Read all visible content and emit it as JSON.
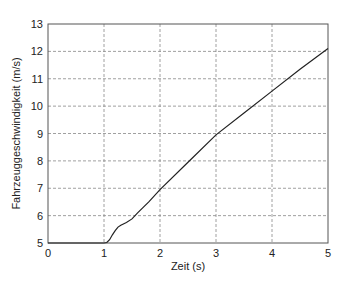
{
  "chart_data": {
    "type": "line",
    "title": "",
    "xlabel": "Zeit (s)",
    "ylabel": "Fahrzeuggeschwindigkeit (m/s)",
    "xlim": [
      0,
      5
    ],
    "ylim": [
      5,
      13
    ],
    "xticks": [
      0,
      1,
      2,
      3,
      4,
      5
    ],
    "yticks": [
      5,
      6,
      7,
      8,
      9,
      10,
      11,
      12,
      13
    ],
    "grid": true,
    "legend": null,
    "series": [
      {
        "name": "Fahrzeuggeschwindigkeit",
        "color": "#222222",
        "x": [
          0,
          0.5,
          1.0,
          1.05,
          1.1,
          1.15,
          1.2,
          1.25,
          1.3,
          1.4,
          1.5,
          1.6,
          1.7,
          1.8,
          2.0,
          2.5,
          3.0,
          3.5,
          4.0,
          4.5,
          5.0
        ],
        "y": [
          5.0,
          5.0,
          5.0,
          5.02,
          5.12,
          5.3,
          5.45,
          5.58,
          5.65,
          5.75,
          5.88,
          6.1,
          6.3,
          6.5,
          6.95,
          7.95,
          8.95,
          9.75,
          10.55,
          11.35,
          12.1
        ]
      }
    ]
  }
}
